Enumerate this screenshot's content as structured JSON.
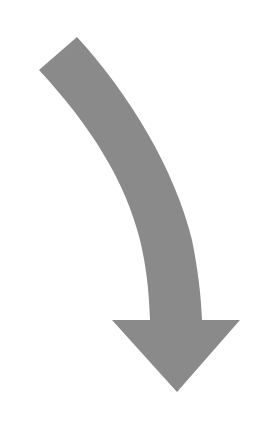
{
  "figure": {
    "type": "curved-arrow",
    "direction": "down",
    "colors": {
      "background": "#ffffff",
      "arrow_fill": "#8a8a8a"
    }
  }
}
